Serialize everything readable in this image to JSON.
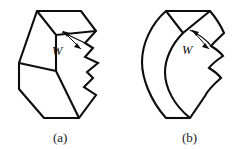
{
  "figure": {
    "kind": "line-drawing",
    "background_color": "#ffffff",
    "stroke_color": "#0d0d0d",
    "panels": [
      {
        "id": "a",
        "caption": "(a)",
        "caption_x": 59,
        "caption_y": 141,
        "description": "chevron prism with straight edges",
        "dimension_label": "W",
        "label_x": 56,
        "label_y": 51
      },
      {
        "id": "b",
        "caption": "(b)",
        "caption_x": 188,
        "caption_y": 141,
        "description": "chevron prism with curved edges",
        "dimension_label": "W",
        "label_x": 186,
        "label_y": 50
      }
    ]
  },
  "panel_a_geometry": {
    "top_face": "M 37,12 L 80,12 L 95,32 L 56,35 Z",
    "left_face": "M 37,12 L 56,35 L 56,72 L 20,64 Z",
    "body_outline": "M 37,12 L 80,12 L 95,32 L 92,48 L 98,62 L 92,77 L 95,94 L 78,117 L 45,117 L 20,88 L 20,64 Z",
    "inner_spine": "M 56,35 L 56,72 L 78,117",
    "left_vertex": "M 20,64 L 56,72",
    "notch_edge": "M 95,32 L 85,44 L 92,48 L 86,56 L 98,62 L 88,71 L 92,77 L 84,86 L 95,94",
    "mid_crease": "M 56,72 L 20,88"
  },
  "panel_b_geometry": {
    "description": "same topology as panel a but with curved silhouette edges"
  },
  "dimension_arrow": {
    "name": "double-headed-arrow",
    "orientation": "diagonal"
  }
}
